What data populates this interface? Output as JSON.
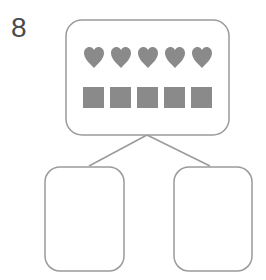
{
  "problem": {
    "number": "8"
  },
  "diagram": {
    "type": "number-bond",
    "stroke_color": "#9a9a9a",
    "fill_color": "#8a8a8a",
    "whole": {
      "hearts": 5,
      "squares": 5
    },
    "parts": [
      {
        "label": ""
      },
      {
        "label": ""
      }
    ]
  }
}
